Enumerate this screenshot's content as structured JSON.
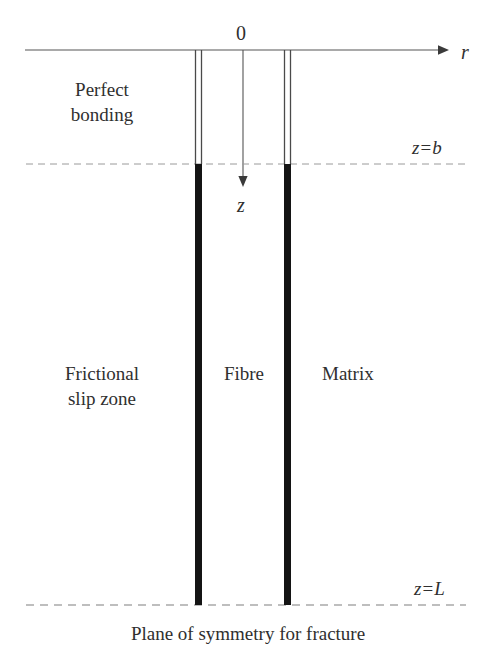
{
  "figure": {
    "type": "schematic-diagram",
    "axes": {
      "radial": {
        "label": "r",
        "direction": "right",
        "origin_label": "0"
      },
      "axial": {
        "label": "z",
        "direction": "down"
      }
    },
    "regions": {
      "perfect_bonding": "Perfect\nbonding",
      "perfect_bonding_line1": "Perfect",
      "perfect_bonding_line2": "bonding",
      "frictional_slip": "Frictional\nslip zone",
      "frictional_slip_line1": "Frictional",
      "frictional_slip_line2": "slip zone",
      "fibre": "Fibre",
      "matrix": "Matrix"
    },
    "markers": {
      "z_b_var": "z",
      "z_b_eq": "=",
      "z_b_val": "b",
      "z_L_var": "z",
      "z_L_eq": "=",
      "z_L_val": "L"
    },
    "caption": "Plane of symmetry for fracture",
    "colors": {
      "interface_black": "#1a1a1a",
      "thin_line": "#555555",
      "dashed_line": "#8a8a8a",
      "text": "#2f2f2f"
    }
  }
}
